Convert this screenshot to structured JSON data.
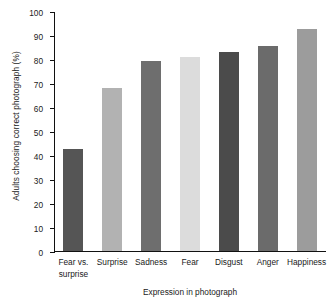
{
  "chart_data": {
    "type": "bar",
    "title": "",
    "xlabel": "Expression in photograph",
    "ylabel": "Adults choosing correct photograph (%)",
    "categories": [
      "Fear vs. surprise",
      "Surprise",
      "Sadness",
      "Fear",
      "Disgust",
      "Anger",
      "Happiness"
    ],
    "values": [
      42.5,
      68,
      79,
      81,
      83,
      85.5,
      92.5
    ],
    "bar_colors": [
      "#555555",
      "#b2b2b2",
      "#6e6e6e",
      "#dcdcdc",
      "#4b4b4b",
      "#6b6b6b",
      "#9c9c9c"
    ],
    "ylim": [
      0,
      100
    ],
    "ytick_labels": [
      "0",
      "10",
      "20",
      "30",
      "40",
      "50",
      "60",
      "70",
      "80",
      "90",
      "100"
    ],
    "ytick_values": [
      0,
      10,
      20,
      30,
      40,
      50,
      60,
      70,
      80,
      90,
      100
    ],
    "grid": false,
    "legend": "none"
  },
  "axis": {
    "y_title": "Adults choosing correct photograph (%)",
    "x_title": "Expression in photograph"
  },
  "category_label_lines": [
    [
      "Fear vs.",
      "surprise"
    ],
    [
      "Surprise",
      ""
    ],
    [
      "Sadness",
      ""
    ],
    [
      "Fear",
      ""
    ],
    [
      "Disgust",
      ""
    ],
    [
      "Anger",
      ""
    ],
    [
      "Happiness",
      ""
    ]
  ]
}
